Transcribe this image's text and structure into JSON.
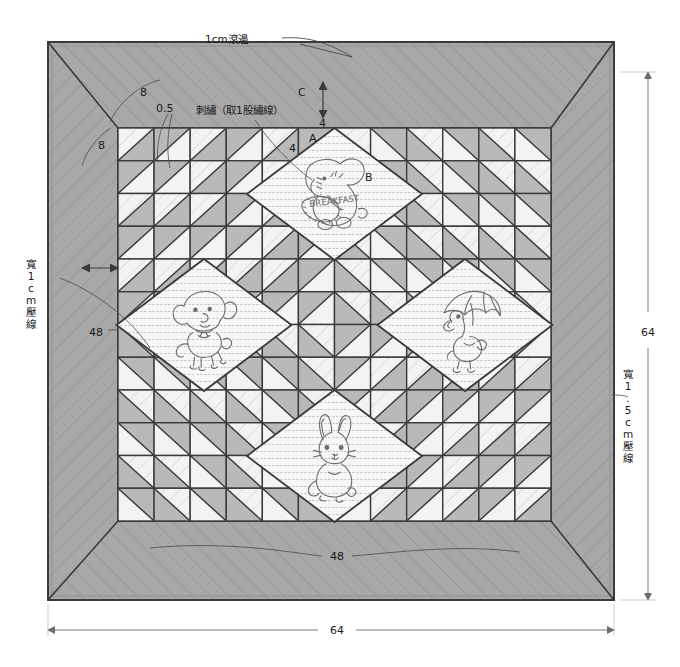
{
  "diagram": {
    "kind": "sewing-pattern"
  },
  "colors": {
    "page_background": "#ffffff",
    "border_fabric": "#a8a8a8",
    "medium_patch": "#b9b9b9",
    "light_patch": "#f3f3f3",
    "appliqué_panel": "#f7f7f7",
    "seam_line": "#3a3a3a",
    "quilting_line": "#8d8d8d",
    "dimension_line": "#6e6e6e",
    "motif_ink": "#6b6b6b",
    "text": "#1a1a1a"
  },
  "labels": {
    "binding": "1cm滾邊",
    "embroidery": "刺繡（取1股繡線）",
    "quilting_left": "寬1cm壓線",
    "quilting_right": "寬1.5cm壓線",
    "corner_left_upper": "8",
    "corner_left_lower": "8",
    "seam_allowance": "0.5",
    "letter_a": "A",
    "letter_b": "B",
    "letter_c": "C",
    "unit_top": "4",
    "unit_inner": "4",
    "unit_c": "4"
  },
  "dimensions": {
    "outer_bottom": "64",
    "outer_right": "64",
    "inner_bottom": "48",
    "inner_left": "48"
  },
  "motifs": [
    {
      "id": "elephant",
      "position": "top",
      "label": "B",
      "caption": "BREAKFAST",
      "description": "elephant with banner"
    },
    {
      "id": "puppy",
      "position": "left",
      "label": "",
      "caption": "",
      "description": "puppy with bow"
    },
    {
      "id": "duckling",
      "position": "right",
      "label": "",
      "caption": "",
      "description": "duckling with umbrella"
    },
    {
      "id": "rabbit",
      "position": "bottom",
      "label": "",
      "caption": "",
      "description": "sitting rabbit"
    }
  ],
  "grid": {
    "columns": 12,
    "rows": 12,
    "unit_label": "4",
    "block_type": "half-square-triangle"
  }
}
